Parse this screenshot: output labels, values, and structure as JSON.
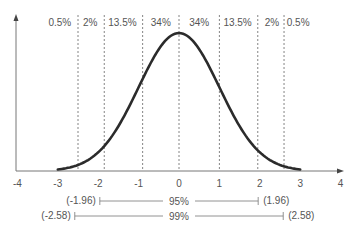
{
  "chart_data": {
    "type": "line",
    "title": "",
    "xlabel": "",
    "ylabel": "",
    "xlim": [
      -4,
      4
    ],
    "x_ticks": [
      "-4",
      "-3",
      "-2",
      "-1",
      "0",
      "1",
      "2",
      "3",
      "4"
    ],
    "grid": false,
    "series": [
      {
        "name": "standard normal pdf",
        "x_range": [
          -3,
          3
        ],
        "peak": {
          "x": 0,
          "y": 0.399
        }
      }
    ],
    "dashed_lines_x": [
      -2.5,
      -1.85,
      -0.9,
      0,
      1.0,
      1.95,
      2.6
    ],
    "region_labels": [
      {
        "label": "0.5%",
        "x_center": -2.95
      },
      {
        "label": "2%",
        "x_center": -2.2
      },
      {
        "label": "13.5%",
        "x_center": -1.4
      },
      {
        "label": "34%",
        "x_center": -0.45
      },
      {
        "label": "34%",
        "x_center": 0.5
      },
      {
        "label": "13.5%",
        "x_center": 1.45
      },
      {
        "label": "2%",
        "x_center": 2.3
      },
      {
        "label": "0.5%",
        "x_center": 2.95
      }
    ],
    "ranges": [
      {
        "label": "95%",
        "lower": -1.96,
        "upper": 1.96,
        "lower_label": "(-1.96)",
        "upper_label": "(1.96)"
      },
      {
        "label": "99%",
        "lower": -2.58,
        "upper": 2.58,
        "lower_label": "(-2.58)",
        "upper_label": "(2.58)"
      }
    ]
  },
  "colors": {
    "curve": "#2b2b2b",
    "axis": "#777777",
    "dashed": "#666666",
    "text": "#555555"
  }
}
